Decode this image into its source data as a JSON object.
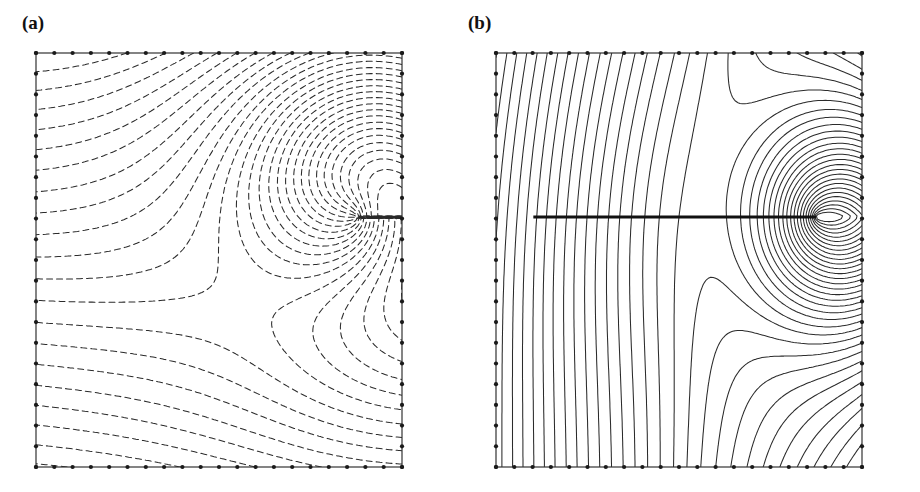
{
  "figure": {
    "background": "#ffffff",
    "line_color": "#2b2b2b",
    "frame_color": "#333333",
    "node_color": "#1a1a1a",
    "crack_color": "#111111",
    "width": 920,
    "height": 492
  },
  "panels": [
    {
      "id": "a",
      "label": "(a)",
      "line_style": "dashed",
      "dash_pattern": "6 4",
      "has_crack_line": false
    },
    {
      "id": "b",
      "label": "(b)",
      "line_style": "solid",
      "dash_pattern": "none",
      "has_crack_line": true
    }
  ],
  "chart_data": {
    "type": "line",
    "title": "",
    "subtitle": "",
    "xlabel": "",
    "ylabel": "",
    "xlim": [
      0,
      1
    ],
    "ylim": [
      0,
      1
    ],
    "grid": false,
    "legend": "none",
    "domain": {
      "x_range": [
        0,
        1
      ],
      "y_range": [
        0,
        1
      ],
      "mesh_nodes_per_edge": 21,
      "mesh_elements_per_edge": 20
    },
    "crack": {
      "tip_x": 0.875,
      "tip_y": 0.396,
      "start_x": 0.102,
      "start_y": 0.396,
      "thickness_px": 3
    },
    "panel_a": {
      "type": "line",
      "line_style": "dashed",
      "n_contours": 30,
      "contour_levels": [
        0.033,
        0.066,
        0.1,
        0.133,
        0.166,
        0.2,
        0.233,
        0.266,
        0.3,
        0.333,
        0.366,
        0.4,
        0.433,
        0.466,
        0.5,
        0.533,
        0.566,
        0.6,
        0.633,
        0.666,
        0.7,
        0.733,
        0.766,
        0.8,
        0.833,
        0.866,
        0.9,
        0.933,
        0.966,
        1.0
      ],
      "family": "equipotential",
      "note": "Contours start nearly horizontal on the left boundary and sweep into the crack tip, fanning out radially around it."
    },
    "panel_b": {
      "type": "line",
      "line_style": "solid",
      "n_contours": 34,
      "contour_levels": [
        0.029,
        0.058,
        0.088,
        0.117,
        0.147,
        0.176,
        0.205,
        0.235,
        0.264,
        0.294,
        0.323,
        0.352,
        0.382,
        0.411,
        0.441,
        0.47,
        0.5,
        0.529,
        0.558,
        0.588,
        0.617,
        0.647,
        0.676,
        0.705,
        0.735,
        0.764,
        0.794,
        0.823,
        0.852,
        0.882,
        0.911,
        0.941,
        0.97,
        1.0
      ],
      "family": "flux",
      "note": "Contours leave the top edge nearly vertically, bend around the crack and wrap the crack tip in nested loops."
    }
  }
}
